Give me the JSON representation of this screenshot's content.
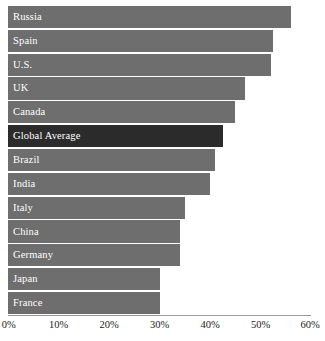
{
  "chart_data": {
    "type": "bar",
    "orientation": "horizontal",
    "title": "",
    "xlabel": "",
    "ylabel": "",
    "xlim": [
      0,
      60
    ],
    "grid": false,
    "legend": null,
    "categories": [
      "Russia",
      "Spain",
      "U.S.",
      "UK",
      "Canada",
      "Global Average",
      "Brazil",
      "India",
      "Italy",
      "China",
      "Germany",
      "Japan",
      "France"
    ],
    "values": [
      56,
      52.5,
      52,
      47,
      45,
      42.5,
      41,
      40,
      35,
      34,
      34,
      30,
      30
    ],
    "tick_labels": [
      "0%",
      "10%",
      "20%",
      "30%",
      "40%",
      "50%",
      "60%"
    ],
    "tick_values": [
      0,
      10,
      20,
      30,
      40,
      50,
      60
    ],
    "bars": [
      {
        "label": "Russia",
        "value": 56,
        "highlight": false
      },
      {
        "label": "Spain",
        "value": 52.5,
        "highlight": false
      },
      {
        "label": "U.S.",
        "value": 52,
        "highlight": false
      },
      {
        "label": "UK",
        "value": 47,
        "highlight": false
      },
      {
        "label": "Canada",
        "value": 45,
        "highlight": false
      },
      {
        "label": "Global Average",
        "value": 42.5,
        "highlight": true
      },
      {
        "label": "Brazil",
        "value": 41,
        "highlight": false
      },
      {
        "label": "India",
        "value": 40,
        "highlight": false
      },
      {
        "label": "Italy",
        "value": 35,
        "highlight": false
      },
      {
        "label": "China",
        "value": 34,
        "highlight": false
      },
      {
        "label": "Germany",
        "value": 34,
        "highlight": false
      },
      {
        "label": "Japan",
        "value": 30,
        "highlight": false
      },
      {
        "label": "France",
        "value": 30,
        "highlight": false
      }
    ],
    "colors": {
      "bar": "#6e6e6e",
      "bar_highlight": "#2b2b2b",
      "bar_label_text": "#ffffff",
      "axis_line": "#9a9a9a",
      "tick_text": "#1a1a1a",
      "background": "#ffffff"
    }
  }
}
